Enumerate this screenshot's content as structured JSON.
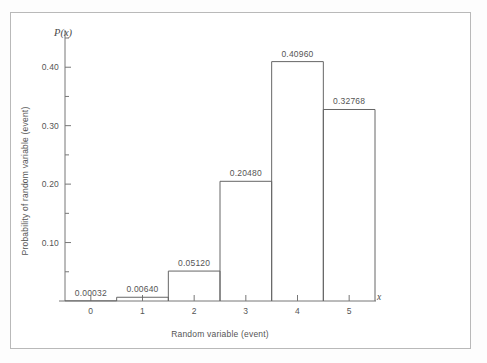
{
  "chart_data": {
    "type": "bar",
    "title": "",
    "subtitle": "",
    "xlabel": "Random variable (event)",
    "ylabel": "Probability of random variable (event)",
    "x_axis_symbol": "x",
    "y_axis_symbol": "P(x)",
    "categories": [
      "0",
      "1",
      "2",
      "3",
      "4",
      "5"
    ],
    "values": [
      0.00032,
      0.0064,
      0.0512,
      0.2048,
      0.4096,
      0.32768
    ],
    "point_labels": [
      "0.00032",
      "0.00640",
      "0.05120",
      "0.20480",
      "0.40960",
      "0.32768"
    ],
    "xlim": [
      -0.5,
      5.5
    ],
    "ylim": [
      0.0,
      0.45
    ],
    "y_major_ticks": [
      0.1,
      0.2,
      0.3,
      0.4
    ],
    "y_major_tick_labels": [
      "0.10",
      "0.20",
      "0.30",
      "0.40"
    ],
    "y_minor_ticks": [
      0.05,
      0.15,
      0.25,
      0.35,
      0.45
    ],
    "x_ticks": [
      0,
      1,
      2,
      3,
      4,
      5
    ],
    "x_tick_labels": [
      "0",
      "1",
      "2",
      "3",
      "4",
      "5"
    ],
    "grid": false,
    "legend": null,
    "legend_position": "none",
    "bar_fill": "none",
    "bar_edge_color": "#666666",
    "axis_color": "#777777",
    "text_color": "#555555",
    "background_color": "#ffffff",
    "frame_color": "#b9b9b9"
  }
}
